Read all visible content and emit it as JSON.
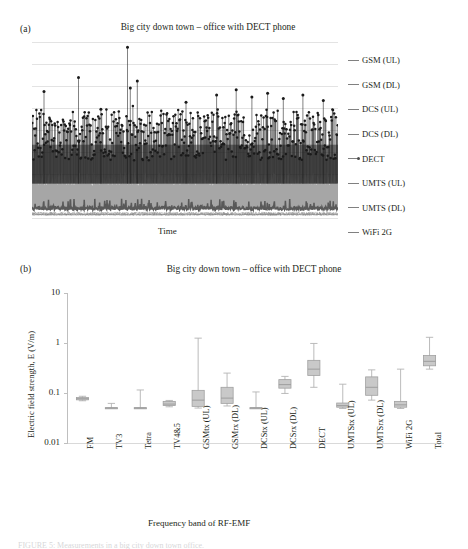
{
  "figure": {
    "panel_a_letter": "(a)",
    "panel_b_letter": "(b)",
    "bottom_caption": "FIGURE 5: Measurements in a big city down town office."
  },
  "panel_a": {
    "title": "Big city down town – office with DECT phone",
    "xlabel": "Time",
    "legend_title": "",
    "legend": [
      {
        "label": "GSM (UL)",
        "color": "#8c8c8c",
        "marker": "line"
      },
      {
        "label": "GSM (DL)",
        "color": "#6e6e6e",
        "marker": "line"
      },
      {
        "label": "DCS (UL)",
        "color": "#8c8c8c",
        "marker": "line"
      },
      {
        "label": "DCS (DL)",
        "color": "#9a9a9a",
        "marker": "line"
      },
      {
        "label": "DECT",
        "color": "#4d4d4d",
        "marker": "line-dot"
      },
      {
        "label": "UMTS (UL)",
        "color": "#6e6e6e",
        "marker": "line"
      },
      {
        "label": "UMTS (DL)",
        "color": "#9a9a9a",
        "marker": "line"
      },
      {
        "label": "WiFi 2G",
        "color": "#8c8c8c",
        "marker": "line"
      }
    ],
    "gridlines": 8
  },
  "chart_data": [
    {
      "type": "line",
      "title": "Big city down town – office with DECT phone",
      "xlabel": "Time",
      "ylabel": "",
      "grid": true,
      "legend_position": "right",
      "note": "Dense time series of RF-EMF exposure; DECT (dark, with dot markers) dominates with tall intermittent spikes, UMTS (DL) forms the light-grey band below, WiFi 2G is the flat dark trace near the baseline.",
      "series": [
        {
          "name": "DECT",
          "color": "#2b2b2b",
          "band_low": 0.33,
          "band_high": 0.62,
          "spikes": [
            0.72,
            0.8,
            0.97,
            0.78,
            0.7,
            0.74,
            0.69,
            0.71,
            0.68,
            0.73
          ]
        },
        {
          "name": "UMTS (DL)",
          "color": "#a6a6a6",
          "band_low": 0.12,
          "band_high": 0.27,
          "spikes": []
        },
        {
          "name": "WiFi 2G",
          "color": "#595959",
          "band_low": 0.05,
          "band_high": 0.09,
          "spikes": []
        },
        {
          "name": "GSM (UL)",
          "color": "#8c8c8c",
          "band_low": 0.02,
          "band_high": 0.04,
          "spikes": []
        },
        {
          "name": "GSM (DL)",
          "color": "#6e6e6e",
          "band_low": 0.02,
          "band_high": 0.04,
          "spikes": []
        },
        {
          "name": "DCS (UL)",
          "color": "#8c8c8c",
          "band_low": 0.02,
          "band_high": 0.03,
          "spikes": []
        },
        {
          "name": "DCS (DL)",
          "color": "#9a9a9a",
          "band_low": 0.02,
          "band_high": 0.03,
          "spikes": []
        },
        {
          "name": "UMTS (UL)",
          "color": "#6e6e6e",
          "band_low": 0.02,
          "band_high": 0.03,
          "spikes": []
        }
      ]
    },
    {
      "type": "box",
      "title": "Big city down town – office with DECT phone",
      "xlabel": "Frequency band of RF-EMF",
      "ylabel": "Electric field strength, E (V/m)",
      "yscale": "log",
      "ylim": [
        0.01,
        10
      ],
      "yticks": [
        10,
        1,
        0.1,
        0.01
      ],
      "ytick_labels": [
        "10",
        "1",
        "0.1",
        "0.01"
      ],
      "grid": false,
      "categories": [
        "FM",
        "TV3",
        "Tetra",
        "TV4&5",
        "GSMtx (UL)",
        "GSMrx (DL)",
        "DCStx (UL)",
        "DCSrx (DL)",
        "DECT",
        "UMTStx (UL)",
        "UMTSrx (DL)",
        "WiFi 2G",
        "Total"
      ],
      "boxes": [
        {
          "category": "FM",
          "whisker_low": 0.07,
          "q1": 0.073,
          "median": 0.077,
          "q3": 0.081,
          "whisker_high": 0.086
        },
        {
          "category": "TV3",
          "whisker_low": 0.049,
          "q1": 0.049,
          "median": 0.05,
          "q3": 0.051,
          "whisker_high": 0.062
        },
        {
          "category": "Tetra",
          "whisker_low": 0.049,
          "q1": 0.049,
          "median": 0.05,
          "q3": 0.051,
          "whisker_high": 0.115
        },
        {
          "category": "TV4&5",
          "whisker_low": 0.053,
          "q1": 0.056,
          "median": 0.06,
          "q3": 0.068,
          "whisker_high": 0.071
        },
        {
          "category": "GSMtx (UL)",
          "whisker_low": 0.05,
          "q1": 0.054,
          "median": 0.072,
          "q3": 0.113,
          "whisker_high": 1.25
        },
        {
          "category": "GSMrx (DL)",
          "whisker_low": 0.055,
          "q1": 0.062,
          "median": 0.079,
          "q3": 0.13,
          "whisker_high": 0.25
        },
        {
          "category": "DCStx (UL)",
          "whisker_low": 0.049,
          "q1": 0.049,
          "median": 0.05,
          "q3": 0.051,
          "whisker_high": 0.105
        },
        {
          "category": "DCSrx (DL)",
          "whisker_low": 0.098,
          "q1": 0.125,
          "median": 0.147,
          "q3": 0.185,
          "whisker_high": 0.215
        },
        {
          "category": "DECT",
          "whisker_low": 0.13,
          "q1": 0.225,
          "median": 0.3,
          "q3": 0.45,
          "whisker_high": 0.98
        },
        {
          "category": "UMTStx (UL)",
          "whisker_low": 0.049,
          "q1": 0.052,
          "median": 0.056,
          "q3": 0.063,
          "whisker_high": 0.15
        },
        {
          "category": "UMTSrx (DL)",
          "whisker_low": 0.072,
          "q1": 0.09,
          "median": 0.13,
          "q3": 0.21,
          "whisker_high": 0.29
        },
        {
          "category": "WiFi 2G",
          "whisker_low": 0.049,
          "q1": 0.052,
          "median": 0.058,
          "q3": 0.068,
          "whisker_high": 0.3
        },
        {
          "category": "Total",
          "whisker_low": 0.3,
          "q1": 0.35,
          "median": 0.43,
          "q3": 0.56,
          "whisker_high": 1.3
        }
      ],
      "box_fill": "#c9c9c9",
      "box_stroke": "#a0a0a0",
      "whisker_color": "#b3b3b3"
    }
  ]
}
